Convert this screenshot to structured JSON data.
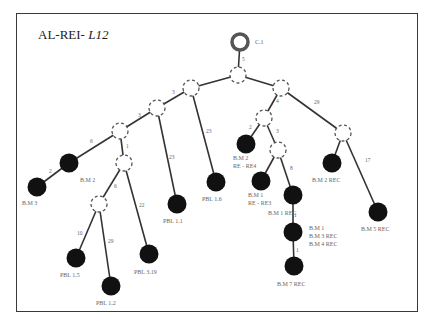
{
  "title": {
    "prefix": "AL-REI- ",
    "italic": "L12"
  },
  "root": {
    "label": "C.1",
    "x": 240,
    "y": 42
  },
  "hubs": [
    {
      "id": "A",
      "x": 238,
      "y": 75
    },
    {
      "id": "L1",
      "x": 191,
      "y": 88
    },
    {
      "id": "L2",
      "x": 157,
      "y": 108
    },
    {
      "id": "L3",
      "x": 120,
      "y": 131
    },
    {
      "id": "L4",
      "x": 124,
      "y": 163
    },
    {
      "id": "L5",
      "x": 99,
      "y": 204
    },
    {
      "id": "R1",
      "x": 281,
      "y": 88
    },
    {
      "id": "R2",
      "x": 264,
      "y": 118
    },
    {
      "id": "R3",
      "x": 278,
      "y": 150
    },
    {
      "id": "RR",
      "x": 343,
      "y": 133
    }
  ],
  "leaves": [
    {
      "id": "BM2",
      "x": 69,
      "y": 163,
      "labels": [
        "B.M 2"
      ],
      "lx": 80,
      "ly": 182
    },
    {
      "id": "BM3",
      "x": 37,
      "y": 187,
      "labels": [
        "B.M 3"
      ],
      "lx": 22,
      "ly": 205
    },
    {
      "id": "PBL15",
      "x": 76,
      "y": 258,
      "labels": [
        "PBL 1.5"
      ],
      "lx": 60,
      "ly": 277
    },
    {
      "id": "PBL12",
      "x": 111,
      "y": 286,
      "labels": [
        "PBL 1.2"
      ],
      "lx": 96,
      "ly": 305
    },
    {
      "id": "PBL319",
      "x": 149,
      "y": 254,
      "labels": [
        "PBL 3.19"
      ],
      "lx": 134,
      "ly": 274
    },
    {
      "id": "PBL11",
      "x": 177,
      "y": 204,
      "labels": [
        "PBL 1.1"
      ],
      "lx": 163,
      "ly": 223
    },
    {
      "id": "PBL16",
      "x": 216,
      "y": 182,
      "labels": [
        "PBL 1.6"
      ],
      "lx": 202,
      "ly": 201
    },
    {
      "id": "BM2RE4",
      "x": 246,
      "y": 144,
      "labels": [
        "B.M 2",
        "RE - RE4"
      ],
      "lx": 233,
      "ly": 160
    },
    {
      "id": "BM1RE3",
      "x": 261,
      "y": 181,
      "labels": [
        "B.M 1",
        "RE - RE3"
      ],
      "lx": 248,
      "ly": 197
    },
    {
      "id": "BM1REC",
      "x": 293,
      "y": 195,
      "labels": [
        "B.M   1 REC"
      ],
      "lx": 268,
      "ly": 215
    },
    {
      "id": "BM134",
      "x": 293,
      "y": 232,
      "labels": [
        "B.M 1",
        "B.M 3 REC",
        "B.M 4 REC"
      ],
      "lx": 309,
      "ly": 230
    },
    {
      "id": "BM7REC",
      "x": 294,
      "y": 266,
      "labels": [
        "B.M 7 REC"
      ],
      "lx": 277,
      "ly": 286
    },
    {
      "id": "BM2REC",
      "x": 332,
      "y": 163,
      "labels": [
        "B.M 2 REC"
      ],
      "lx": 312,
      "ly": 182
    },
    {
      "id": "BM5REC",
      "x": 378,
      "y": 212,
      "labels": [
        "B.M 5 REC"
      ],
      "lx": 361,
      "ly": 231
    }
  ],
  "edges": [
    {
      "from": "root",
      "to": "A",
      "weight": "5",
      "lx": 242,
      "ly": 61
    },
    {
      "from": "A",
      "to": "L1",
      "weight": "",
      "lx": 0,
      "ly": 0
    },
    {
      "from": "A",
      "to": "R1",
      "weight": "",
      "lx": 0,
      "ly": 0
    },
    {
      "from": "L1",
      "to": "L2",
      "weight": "3",
      "lx": 172,
      "ly": 94
    },
    {
      "from": "L2",
      "to": "L3",
      "weight": "3",
      "lx": 138,
      "ly": 117
    },
    {
      "from": "L3",
      "to": "BM2",
      "weight": "6",
      "lx": 90,
      "ly": 143
    },
    {
      "from": "BM2",
      "to": "BM3",
      "weight": "2",
      "lx": 49,
      "ly": 173
    },
    {
      "from": "L3",
      "to": "L4",
      "weight": "1",
      "lx": 126,
      "ly": 148
    },
    {
      "from": "L4",
      "to": "L5",
      "weight": "6",
      "lx": 114,
      "ly": 188
    },
    {
      "from": "L5",
      "to": "PBL15",
      "weight": "10",
      "lx": 77,
      "ly": 235
    },
    {
      "from": "L5",
      "to": "PBL12",
      "weight": "29",
      "lx": 108,
      "ly": 243
    },
    {
      "from": "L4",
      "to": "PBL319",
      "weight": "22",
      "lx": 139,
      "ly": 207
    },
    {
      "from": "L2",
      "to": "PBL11",
      "weight": "23",
      "lx": 169,
      "ly": 159
    },
    {
      "from": "L1",
      "to": "PBL16",
      "weight": "23",
      "lx": 206,
      "ly": 133
    },
    {
      "from": "R1",
      "to": "R2",
      "weight": "4",
      "lx": 276,
      "ly": 103
    },
    {
      "from": "R2",
      "to": "BM2RE4",
      "weight": "2",
      "lx": 249,
      "ly": 129
    },
    {
      "from": "R2",
      "to": "R3",
      "weight": "3",
      "lx": 276,
      "ly": 133
    },
    {
      "from": "R3",
      "to": "BM1RE3",
      "weight": "",
      "lx": 0,
      "ly": 0
    },
    {
      "from": "R3",
      "to": "BM1REC",
      "weight": "8",
      "lx": 290,
      "ly": 170
    },
    {
      "from": "BM1REC",
      "to": "BM134",
      "weight": "1",
      "lx": 294,
      "ly": 217
    },
    {
      "from": "BM134",
      "to": "BM7REC",
      "weight": "1",
      "lx": 296,
      "ly": 252
    },
    {
      "from": "R1",
      "to": "RR",
      "weight": "29",
      "lx": 314,
      "ly": 104
    },
    {
      "from": "RR",
      "to": "BM2REC",
      "weight": "",
      "lx": 0,
      "ly": 0
    },
    {
      "from": "RR",
      "to": "BM5REC",
      "weight": "17",
      "lx": 365,
      "ly": 162
    }
  ]
}
